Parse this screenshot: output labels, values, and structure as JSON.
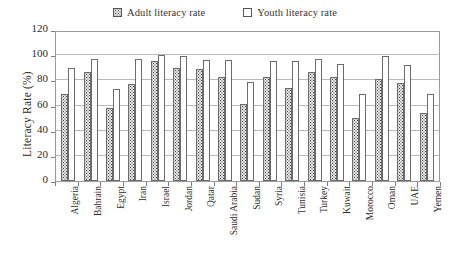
{
  "legend": {
    "entries": [
      {
        "label": "Adult literacy rate",
        "swatch": "adult",
        "icon": "dotted-square-icon"
      },
      {
        "label": "Youth literacy rate",
        "swatch": "youth",
        "icon": "empty-square-icon"
      }
    ]
  },
  "axis": {
    "ylabel": "Literacy Rate (%)",
    "yticks": [
      "0",
      "20",
      "40",
      "60",
      "80",
      "100",
      "120"
    ]
  },
  "chart_data": {
    "type": "bar",
    "title": "",
    "xlabel": "",
    "ylabel": "Literacy Rate (%)",
    "ylim": [
      0,
      120
    ],
    "yticks": [
      0,
      20,
      40,
      60,
      80,
      100,
      120
    ],
    "grid": true,
    "legend_position": "top-center",
    "categories": [
      "Algeria",
      "Bahrain",
      "Egypt",
      "Iran",
      "Israel",
      "Jordan",
      "Qatar",
      "Saudi Arabia",
      "Sudan",
      "Syria",
      "Tunisia",
      "Turkey",
      "Kuwait",
      "Morocco",
      "Oman",
      "UAE",
      "Yemen"
    ],
    "series": [
      {
        "name": "Adult literacy rate",
        "values": [
          69,
          87,
          58,
          77,
          95,
          90,
          89,
          83,
          61,
          83,
          74,
          87,
          83,
          50,
          81,
          78,
          54
        ]
      },
      {
        "name": "Youth literacy rate",
        "values": [
          90,
          97,
          73,
          97,
          100,
          99,
          96,
          96,
          79,
          95,
          95,
          97,
          93,
          69,
          99,
          92,
          69
        ]
      }
    ]
  }
}
